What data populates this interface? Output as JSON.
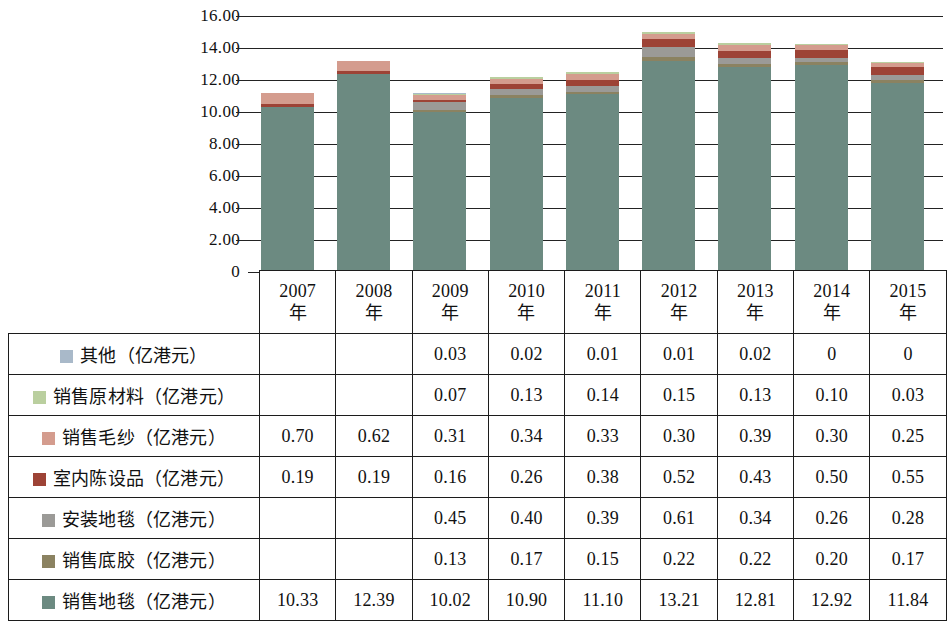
{
  "chart_data": {
    "type": "bar",
    "subtype": "stacked",
    "title": "",
    "xlabel": "",
    "ylabel": "",
    "ylim": [
      0,
      16
    ],
    "ytick_labels": [
      "16.00",
      "14.00",
      "12.00",
      "10.00",
      "8.00",
      "6.00",
      "4.00",
      "2.00",
      "0"
    ],
    "ytick_values": [
      16,
      14,
      12,
      10,
      8,
      6,
      4,
      2,
      0
    ],
    "grid": true,
    "legend_position": "table-row-labels",
    "categories": [
      "2007年",
      "2008年",
      "2009年",
      "2010年",
      "2011年",
      "2012年",
      "2013年",
      "2014年",
      "2015年"
    ],
    "series": [
      {
        "name": "销售地毯（亿港元）",
        "color": "#6c8a81",
        "values": [
          10.33,
          12.39,
          10.02,
          10.9,
          11.1,
          13.21,
          12.81,
          12.92,
          11.84
        ],
        "display": [
          "10.33",
          "12.39",
          "10.02",
          "10.90",
          "11.10",
          "13.21",
          "12.81",
          "12.92",
          "11.84"
        ]
      },
      {
        "name": "销售底胶（亿港元）",
        "color": "#8b8261",
        "values": [
          null,
          null,
          0.13,
          0.17,
          0.15,
          0.22,
          0.22,
          0.2,
          0.17
        ],
        "display": [
          "",
          "",
          "0.13",
          "0.17",
          "0.15",
          "0.22",
          "0.22",
          "0.20",
          "0.17"
        ]
      },
      {
        "name": "安装地毯（亿港元）",
        "color": "#9b9a97",
        "values": [
          null,
          null,
          0.45,
          0.4,
          0.39,
          0.61,
          0.34,
          0.26,
          0.28
        ],
        "display": [
          "",
          "",
          "0.45",
          "0.40",
          "0.39",
          "0.61",
          "0.34",
          "0.26",
          "0.28"
        ]
      },
      {
        "name": "室内陈设品（亿港元）",
        "color": "#9d4336",
        "values": [
          0.19,
          0.19,
          0.16,
          0.26,
          0.38,
          0.52,
          0.43,
          0.5,
          0.55
        ],
        "display": [
          "0.19",
          "0.19",
          "0.16",
          "0.26",
          "0.38",
          "0.52",
          "0.43",
          "0.50",
          "0.55"
        ]
      },
      {
        "name": "销售毛纱（亿港元）",
        "color": "#d49c8e",
        "values": [
          0.7,
          0.62,
          0.31,
          0.34,
          0.33,
          0.3,
          0.39,
          0.3,
          0.25
        ],
        "display": [
          "0.70",
          "0.62",
          "0.31",
          "0.34",
          "0.33",
          "0.30",
          "0.39",
          "0.30",
          "0.25"
        ]
      },
      {
        "name": "销售原材料（亿港元）",
        "color": "#bacf9f",
        "values": [
          null,
          null,
          0.07,
          0.13,
          0.14,
          0.15,
          0.13,
          0.1,
          0.03
        ],
        "display": [
          "",
          "",
          "0.07",
          "0.13",
          "0.14",
          "0.15",
          "0.13",
          "0.10",
          "0.03"
        ]
      },
      {
        "name": "其他（亿港元）",
        "color": "#a9b9c9",
        "values": [
          null,
          null,
          0.03,
          0.02,
          0.01,
          0.01,
          0.02,
          0.0,
          0.0
        ],
        "display": [
          "",
          "",
          "0.03",
          "0.02",
          "0.01",
          "0.01",
          "0.02",
          "0",
          "0"
        ]
      }
    ],
    "totals": [
      11.22,
      13.2,
      11.17,
      12.22,
      12.5,
      14.92,
      14.34,
      14.28,
      12.92
    ]
  },
  "table": {
    "year_headers": [
      {
        "num": "2007",
        "suffix": "年"
      },
      {
        "num": "2008",
        "suffix": "年"
      },
      {
        "num": "2009",
        "suffix": "年"
      },
      {
        "num": "2010",
        "suffix": "年"
      },
      {
        "num": "2011",
        "suffix": "年"
      },
      {
        "num": "2012",
        "suffix": "年"
      },
      {
        "num": "2013",
        "suffix": "年"
      },
      {
        "num": "2014",
        "suffix": "年"
      },
      {
        "num": "2015",
        "suffix": "年"
      }
    ],
    "rows": [
      {
        "label": "其他（亿港元）",
        "color": "#a9b9c9",
        "values": [
          "",
          "",
          "0.03",
          "0.02",
          "0.01",
          "0.01",
          "0.02",
          "0",
          "0"
        ]
      },
      {
        "label": "销售原材料（亿港元）",
        "color": "#bacf9f",
        "values": [
          "",
          "",
          "0.07",
          "0.13",
          "0.14",
          "0.15",
          "0.13",
          "0.10",
          "0.03"
        ]
      },
      {
        "label": "销售毛纱（亿港元）",
        "color": "#d49c8e",
        "values": [
          "0.70",
          "0.62",
          "0.31",
          "0.34",
          "0.33",
          "0.30",
          "0.39",
          "0.30",
          "0.25"
        ]
      },
      {
        "label": "室内陈设品（亿港元）",
        "color": "#9d4336",
        "values": [
          "0.19",
          "0.19",
          "0.16",
          "0.26",
          "0.38",
          "0.52",
          "0.43",
          "0.50",
          "0.55"
        ]
      },
      {
        "label": "安装地毯（亿港元）",
        "color": "#9b9a97",
        "values": [
          "",
          "",
          "0.45",
          "0.40",
          "0.39",
          "0.61",
          "0.34",
          "0.26",
          "0.28"
        ]
      },
      {
        "label": "销售底胶（亿港元）",
        "color": "#8b8261",
        "values": [
          "",
          "",
          "0.13",
          "0.17",
          "0.15",
          "0.22",
          "0.22",
          "0.20",
          "0.17"
        ]
      },
      {
        "label": "销售地毯（亿港元）",
        "color": "#6c8a81",
        "values": [
          "10.33",
          "12.39",
          "10.02",
          "10.90",
          "11.10",
          "13.21",
          "12.81",
          "12.92",
          "11.84"
        ]
      }
    ]
  },
  "colors": {
    "axis": "#232323",
    "grid": "#232323",
    "table_border": "#1c1c1c",
    "background": "#ffffff"
  }
}
